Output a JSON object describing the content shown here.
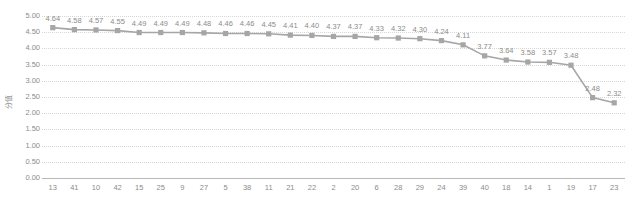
{
  "chart_data": {
    "type": "line",
    "title": "",
    "xlabel": "",
    "ylabel": "分值",
    "ylim": [
      0.0,
      5.0
    ],
    "ytick_labels": [
      "5.00",
      "4.50",
      "4.00",
      "3.50",
      "3.00",
      "2.50",
      "2.00",
      "1.50",
      "1.00",
      "0.50",
      "0.00"
    ],
    "ytick_values": [
      5.0,
      4.5,
      4.0,
      3.5,
      3.0,
      2.5,
      2.0,
      1.5,
      1.0,
      0.5,
      0.0
    ],
    "grid": true,
    "legend": "none",
    "marker": "square",
    "series_color": "#a6a6a6",
    "categories": [
      "13",
      "41",
      "10",
      "42",
      "15",
      "25",
      "9",
      "27",
      "5",
      "38",
      "11",
      "21",
      "22",
      "2",
      "20",
      "6",
      "28",
      "29",
      "24",
      "39",
      "40",
      "18",
      "14",
      "1",
      "19",
      "17",
      "23"
    ],
    "values": [
      4.64,
      4.58,
      4.57,
      4.55,
      4.49,
      4.49,
      4.49,
      4.48,
      4.46,
      4.46,
      4.45,
      4.41,
      4.4,
      4.37,
      4.37,
      4.33,
      4.32,
      4.3,
      4.24,
      4.11,
      3.77,
      3.64,
      3.58,
      3.57,
      3.48,
      2.48,
      2.32
    ],
    "data_labels": [
      "4.64",
      "4.58",
      "4.57",
      "4.55",
      "4.49",
      "4.49",
      "4.49",
      "4.48",
      "4.46",
      "4.46",
      "4.45",
      "4.41",
      "4.40",
      "4.37",
      "4.37",
      "4.33",
      "4.32",
      "4.30",
      "4.24",
      "4.11",
      "3.77",
      "3.64",
      "3.58",
      "3.57",
      "3.48",
      "2.48",
      "2.32"
    ]
  }
}
